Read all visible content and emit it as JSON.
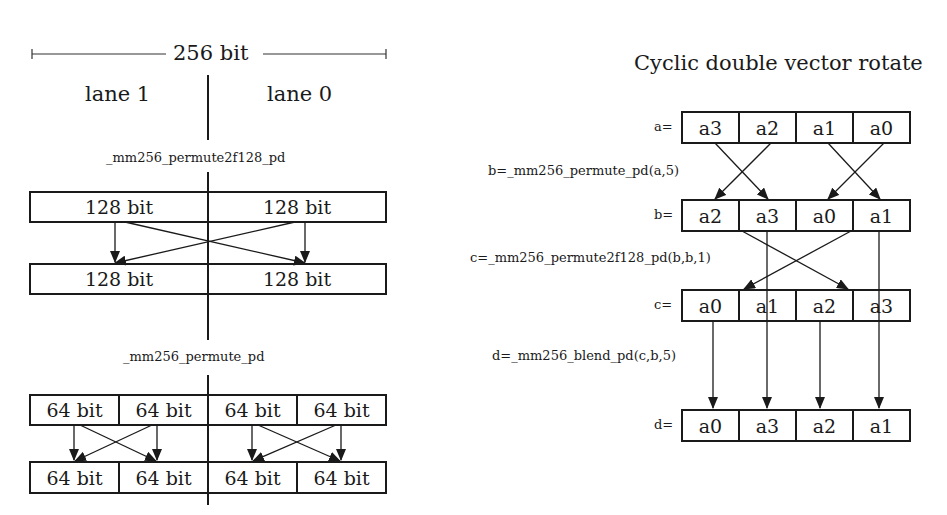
{
  "left": {
    "width_label": "256 bit",
    "lanes": [
      "lane 1",
      "lane 0"
    ],
    "permute2f128": {
      "title": "_mm256_permute2f128_pd",
      "top": [
        "128 bit",
        "128 bit"
      ],
      "bottom": [
        "128 bit",
        "128 bit"
      ]
    },
    "permute": {
      "title": "_mm256_permute_pd",
      "top": [
        "64 bit",
        "64 bit",
        "64 bit",
        "64 bit"
      ],
      "bottom": [
        "64 bit",
        "64 bit",
        "64 bit",
        "64 bit"
      ]
    }
  },
  "right": {
    "title": "Cyclic double vector rotate",
    "rows": [
      {
        "label": "a=",
        "cells": [
          "a3",
          "a2",
          "a1",
          "a0"
        ]
      },
      {
        "label": "b=",
        "cells": [
          "a2",
          "a3",
          "a0",
          "a1"
        ]
      },
      {
        "label": "c=",
        "cells": [
          "a0",
          "a1",
          "a2",
          "a3"
        ]
      },
      {
        "label": "d=",
        "cells": [
          "a0",
          "a3",
          "a2",
          "a1"
        ]
      }
    ],
    "ops": [
      "b=_mm256_permute_pd(a,5)",
      "c=_mm256_permute2f128_pd(b,b,1)",
      "d=_mm256_blend_pd(c,b,5)"
    ]
  }
}
